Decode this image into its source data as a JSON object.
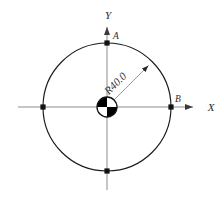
{
  "figure": {
    "kind": "engineering-circle-diagram",
    "canvas": {
      "width": 222,
      "height": 203,
      "background": "#ffffff"
    },
    "colors": {
      "outline": "#1a1a1a",
      "axis": "#8c8c8c",
      "leader": "#8c8c8c",
      "text": "#2b2b2b",
      "hub_fill": "#000000",
      "marker": "#111111"
    },
    "geometry": {
      "center": {
        "x": 107,
        "y": 107
      },
      "circle_radius_px": 64,
      "hub_radius_px": 10,
      "x_axis": {
        "x_start": 18,
        "x_end": 200,
        "y": 107
      },
      "y_axis": {
        "y_start": 190,
        "y_end": 20,
        "x": 107
      },
      "radius_leader_angle_deg": 45
    }
  },
  "axes": {
    "x_label": "X",
    "y_label": "Y"
  },
  "points": [
    {
      "id": "A",
      "label": "A",
      "position": "top",
      "x": 107,
      "y": 43
    },
    {
      "id": "B",
      "label": "B",
      "position": "right",
      "x": 171,
      "y": 107
    },
    {
      "id": "left",
      "label": "",
      "position": "left",
      "x": 43,
      "y": 107
    },
    {
      "id": "bottom",
      "label": "",
      "position": "bottom",
      "x": 107,
      "y": 171
    }
  ],
  "dimensions": [
    {
      "id": "radius",
      "label": "R40.0",
      "prefix": "R",
      "value": 40.0,
      "type": "radius",
      "rotation_deg": -45
    }
  ]
}
